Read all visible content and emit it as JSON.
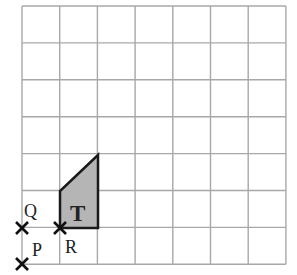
{
  "grid": {
    "columns": 7,
    "rows": 7,
    "origin_x": 22,
    "origin_y": 6,
    "cell_w": 37.7,
    "cell_h": 36.9,
    "line_color": "#a8a8a8"
  },
  "shape": {
    "label": "T",
    "fill": "#b5b5b5",
    "stroke": "#1a1a1a",
    "vertices_grid": [
      [
        1,
        6
      ],
      [
        2,
        6
      ],
      [
        2,
        4
      ],
      [
        1,
        5
      ]
    ]
  },
  "points": [
    {
      "label": "Q",
      "grid": [
        0,
        6
      ],
      "label_pos": "above-right"
    },
    {
      "label": "R",
      "grid": [
        1,
        6
      ],
      "label_pos": "below-right"
    },
    {
      "label": "P",
      "grid": [
        0,
        7
      ],
      "label_pos": "above-right"
    }
  ],
  "labels": {
    "shape": "T",
    "q": "Q",
    "r": "R",
    "p": "P"
  }
}
